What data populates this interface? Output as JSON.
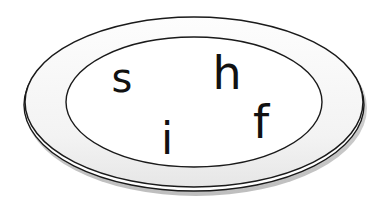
{
  "illustration": {
    "subject": "plate",
    "letters": [
      {
        "char": "s",
        "x": 122,
        "y": 92,
        "size": 38
      },
      {
        "char": "h",
        "x": 227,
        "y": 89,
        "size": 44
      },
      {
        "char": "i",
        "x": 167,
        "y": 154,
        "size": 42
      },
      {
        "char": "f",
        "x": 261,
        "y": 138,
        "size": 44
      }
    ],
    "colors": {
      "outline": "#1a1a1a",
      "plate_fill": "#ffffff",
      "rim_fill": "#f4f4f4",
      "shadow": "#bdbdbd",
      "background": "#ffffff"
    }
  }
}
